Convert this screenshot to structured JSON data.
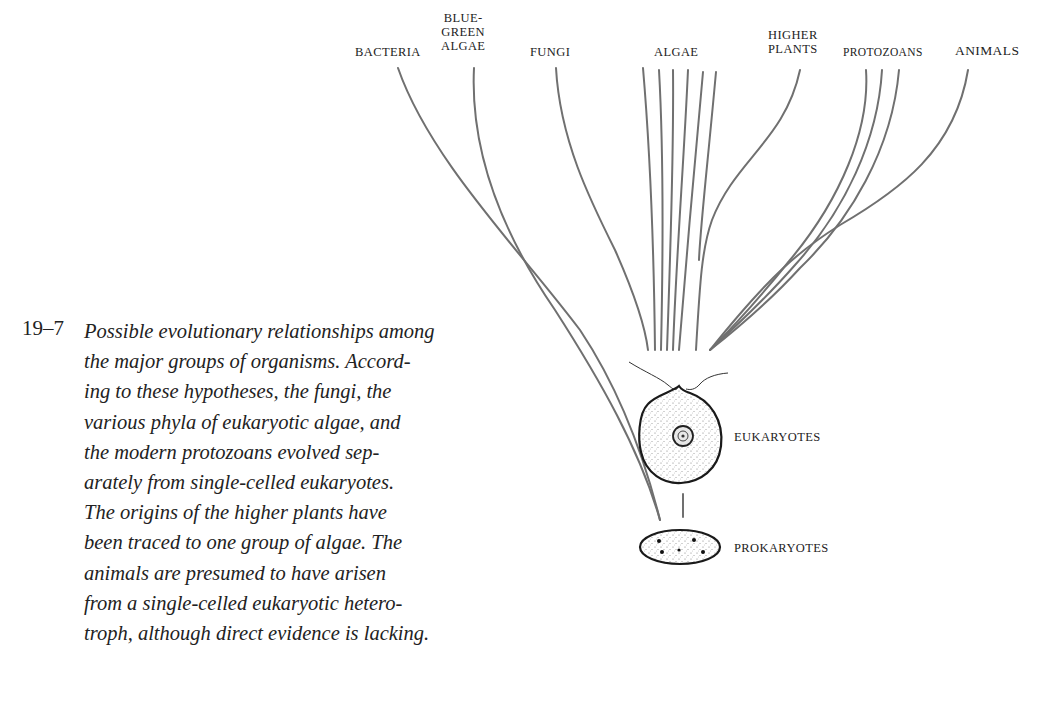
{
  "diagram": {
    "top_labels": [
      {
        "id": "bacteria",
        "lines": [
          "BACTERIA"
        ]
      },
      {
        "id": "blue-green-algae",
        "lines": [
          "BLUE-",
          "GREEN",
          "ALGAE"
        ]
      },
      {
        "id": "fungi",
        "lines": [
          "FUNGI"
        ]
      },
      {
        "id": "algae",
        "lines": [
          "ALGAE"
        ]
      },
      {
        "id": "higher-plants",
        "lines": [
          "HIGHER",
          "PLANTS"
        ]
      },
      {
        "id": "protozoans",
        "lines": [
          "PROTOZOANS"
        ]
      },
      {
        "id": "animals",
        "lines": [
          "ANIMALS"
        ]
      }
    ],
    "cell_labels": {
      "eukaryotes": "EUKARYOTES",
      "prokaryotes": "PROKARYOTES"
    },
    "colors": {
      "line": "#707070",
      "cell_outline": "#1a1a1a",
      "text": "#222222"
    }
  },
  "caption": {
    "figure_number": "19–7",
    "lines": [
      "Possible evolutionary relationships among",
      "the major groups of organisms. Accord-",
      "ing to these hypotheses, the fungi, the",
      "various phyla of eukaryotic algae, and",
      "the modern protozoans evolved sep-",
      "arately from single-celled eukaryotes.",
      "The origins of the higher plants have",
      "been traced to one group of algae. The",
      "animals are presumed to have arisen",
      "from a single-celled eukaryotic hetero-",
      "troph, although direct evidence is lacking."
    ]
  }
}
